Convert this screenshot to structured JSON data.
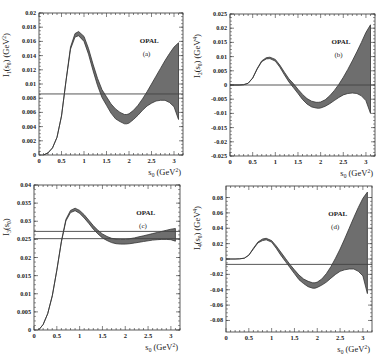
{
  "figure": {
    "experiment_label": "OPAL"
  },
  "chart_data": [
    {
      "id": "a",
      "type": "line",
      "panel_label": "(a)",
      "title": "",
      "legend": "OPAL",
      "xlabel": "s0 (GeV^2)",
      "ylabel": "I1(s0) (GeV^2)",
      "ylabel_main": "I",
      "ylabel_sub": "1",
      "ylabel_rest": "(s",
      "ylabel_unit": ") (GeV",
      "ylabel_pow": "2",
      "xlim": [
        0,
        3.2
      ],
      "ylim": [
        0,
        0.02
      ],
      "xticks": [
        0,
        0.5,
        1,
        1.5,
        2,
        2.5,
        3
      ],
      "xtick_labels": [
        "0",
        "0.5",
        "1",
        "1.5",
        "2",
        "2.5",
        "3"
      ],
      "yticks": [
        0,
        0.002,
        0.004,
        0.006,
        0.008,
        0.01,
        0.012,
        0.014,
        0.016,
        0.018,
        0.02
      ],
      "ytick_labels": [
        "0",
        "0.002",
        "0.004",
        "0.006",
        "0.008",
        "0.01",
        "0.012",
        "0.014",
        "0.016",
        "0.018",
        "0.02"
      ],
      "hlines": [
        0.0086
      ],
      "band": {
        "x": [
          0.1,
          0.2,
          0.3,
          0.4,
          0.5,
          0.6,
          0.7,
          0.8,
          0.88,
          1.0,
          1.1,
          1.2,
          1.3,
          1.4,
          1.5,
          1.6,
          1.7,
          1.8,
          1.9,
          1.95,
          2.0,
          2.1,
          2.2,
          2.3,
          2.4,
          2.5,
          2.6,
          2.7,
          2.8,
          2.9,
          3.0,
          3.1
        ],
        "upper": [
          0.0,
          0.0003,
          0.001,
          0.0025,
          0.0055,
          0.0105,
          0.0152,
          0.0171,
          0.0174,
          0.0167,
          0.015,
          0.0128,
          0.0108,
          0.0092,
          0.0082,
          0.0072,
          0.0065,
          0.006,
          0.0057,
          0.0057,
          0.0058,
          0.0063,
          0.007,
          0.0079,
          0.0089,
          0.01,
          0.0111,
          0.0122,
          0.0133,
          0.0143,
          0.0152,
          0.0158
        ],
        "lower": [
          0.0,
          0.0003,
          0.001,
          0.0025,
          0.0055,
          0.0104,
          0.0149,
          0.0166,
          0.0168,
          0.016,
          0.0142,
          0.0119,
          0.0098,
          0.0081,
          0.007,
          0.0059,
          0.0051,
          0.0047,
          0.0044,
          0.0044,
          0.0045,
          0.005,
          0.0056,
          0.0063,
          0.0069,
          0.0073,
          0.0076,
          0.0077,
          0.0077,
          0.0074,
          0.0068,
          0.005
        ]
      }
    },
    {
      "id": "b",
      "type": "line",
      "panel_label": "(b)",
      "title": "",
      "legend": "OPAL",
      "xlabel": "s0 (GeV^2)",
      "ylabel": "I2(s0) (GeV^4)",
      "ylabel_main": "I",
      "ylabel_sub": "2",
      "ylabel_rest": "(s",
      "ylabel_unit": ") (GeV",
      "ylabel_pow": "4",
      "xlim": [
        0,
        3.2
      ],
      "ylim": [
        -0.025,
        0.025
      ],
      "xticks": [
        0,
        0.5,
        1,
        1.5,
        2,
        2.5,
        3
      ],
      "xtick_labels": [
        "0",
        "0.5",
        "1",
        "1.5",
        "2",
        "2.5",
        "3"
      ],
      "yticks": [
        -0.025,
        -0.02,
        -0.015,
        -0.01,
        -0.005,
        0,
        0.005,
        0.01,
        0.015,
        0.02,
        0.025
      ],
      "ytick_labels": [
        "-0.025",
        "-0.02",
        "-0.015",
        "-0.01",
        "-0.005",
        "0",
        "0.005",
        "0.01",
        "0.015",
        "0.02",
        "0.025"
      ],
      "hlines": [
        0
      ],
      "band": {
        "x": [
          0.0,
          0.2,
          0.3,
          0.4,
          0.5,
          0.6,
          0.7,
          0.8,
          0.88,
          1.0,
          1.1,
          1.2,
          1.3,
          1.4,
          1.5,
          1.6,
          1.7,
          1.8,
          1.9,
          1.95,
          2.0,
          2.1,
          2.2,
          2.3,
          2.4,
          2.5,
          2.6,
          2.7,
          2.8,
          2.9,
          3.0,
          3.1
        ],
        "upper": [
          0.0,
          0.0,
          0.0001,
          0.0006,
          0.0025,
          0.0058,
          0.0085,
          0.0096,
          0.0098,
          0.009,
          0.007,
          0.0045,
          0.0022,
          0.0005,
          -0.0015,
          -0.0033,
          -0.0048,
          -0.0057,
          -0.0061,
          -0.0061,
          -0.006,
          -0.0052,
          -0.0038,
          -0.002,
          0.0002,
          0.0027,
          0.0055,
          0.0085,
          0.0117,
          0.015,
          0.0185,
          0.0212
        ],
        "lower": [
          0.0,
          0.0,
          0.0001,
          0.0006,
          0.0024,
          0.0056,
          0.0082,
          0.0092,
          0.0093,
          0.0084,
          0.0063,
          0.0036,
          0.0011,
          -0.0009,
          -0.003,
          -0.0051,
          -0.0067,
          -0.0077,
          -0.0081,
          -0.0082,
          -0.0081,
          -0.0075,
          -0.0066,
          -0.0055,
          -0.0044,
          -0.0035,
          -0.003,
          -0.0028,
          -0.003,
          -0.0038,
          -0.0055,
          -0.01
        ]
      }
    },
    {
      "id": "c",
      "type": "line",
      "panel_label": "(c)",
      "title": "",
      "legend": "OPAL",
      "xlabel": "s0 (GeV^2)",
      "ylabel": "I3(s0)",
      "ylabel_main": "I",
      "ylabel_sub": "3",
      "ylabel_rest": "(s",
      "ylabel_unit": ")",
      "ylabel_pow": "",
      "xlim": [
        0,
        3.2
      ],
      "ylim": [
        0,
        0.04
      ],
      "xticks": [
        0,
        0.5,
        1,
        1.5,
        2,
        2.5,
        3
      ],
      "xtick_labels": [
        "0",
        "0.5",
        "1",
        "1.5",
        "2",
        "2.5",
        "3"
      ],
      "yticks": [
        0,
        0.005,
        0.01,
        0.015,
        0.02,
        0.025,
        0.03,
        0.035,
        0.04
      ],
      "ytick_labels": [
        "0",
        "0.005",
        "0.01",
        "0.015",
        "0.02",
        "0.025",
        "0.03",
        "0.035",
        "0.04"
      ],
      "hlines": [
        0.0272,
        0.0252
      ],
      "band": {
        "x": [
          0.1,
          0.2,
          0.3,
          0.4,
          0.5,
          0.6,
          0.7,
          0.8,
          0.9,
          1.0,
          1.1,
          1.2,
          1.3,
          1.4,
          1.5,
          1.6,
          1.7,
          1.8,
          1.9,
          2.0,
          2.1,
          2.2,
          2.3,
          2.4,
          2.5,
          2.6,
          2.7,
          2.8,
          2.9,
          3.0,
          3.1
        ],
        "upper": [
          0.0,
          0.0015,
          0.0045,
          0.0095,
          0.0165,
          0.0245,
          0.0305,
          0.033,
          0.0336,
          0.033,
          0.0318,
          0.0303,
          0.0288,
          0.0275,
          0.0265,
          0.0258,
          0.0253,
          0.0251,
          0.025,
          0.025,
          0.0252,
          0.0254,
          0.0257,
          0.026,
          0.0263,
          0.0266,
          0.0269,
          0.0272,
          0.0275,
          0.0278,
          0.028
        ],
        "lower": [
          0.0,
          0.0015,
          0.0045,
          0.0094,
          0.0164,
          0.0243,
          0.0301,
          0.0324,
          0.0329,
          0.0322,
          0.0309,
          0.0294,
          0.0278,
          0.0265,
          0.0254,
          0.0247,
          0.0241,
          0.0238,
          0.0237,
          0.0237,
          0.0238,
          0.024,
          0.0242,
          0.0244,
          0.0246,
          0.0248,
          0.0249,
          0.025,
          0.025,
          0.0249,
          0.0245
        ]
      }
    },
    {
      "id": "d",
      "type": "line",
      "panel_label": "(d)",
      "title": "",
      "legend": "OPAL",
      "xlabel": "s0 (GeV^2)",
      "ylabel": "I4(s0) (GeV^4)",
      "ylabel_main": "I",
      "ylabel_sub": "4",
      "ylabel_rest": "(s",
      "ylabel_unit": ") (GeV",
      "ylabel_pow": "4",
      "xlim": [
        0,
        3.2
      ],
      "ylim": [
        -0.095,
        0.095
      ],
      "xticks": [
        0,
        0.5,
        1,
        1.5,
        2,
        2.5,
        3
      ],
      "xtick_labels": [
        "0",
        "0.5",
        "1",
        "1.5",
        "2",
        "2.5",
        "3"
      ],
      "yticks": [
        -0.08,
        -0.06,
        -0.04,
        -0.02,
        0,
        0.02,
        0.04,
        0.06,
        0.08
      ],
      "ytick_labels": [
        "-0.08",
        "-0.06",
        "-0.04",
        "-0.02",
        "0",
        "0.02",
        "0.04",
        "0.06",
        "0.08"
      ],
      "hlines": [
        -0.007
      ],
      "band": {
        "x": [
          0.0,
          0.2,
          0.3,
          0.4,
          0.5,
          0.6,
          0.7,
          0.8,
          0.88,
          1.0,
          1.1,
          1.2,
          1.3,
          1.4,
          1.5,
          1.6,
          1.7,
          1.8,
          1.9,
          1.95,
          2.0,
          2.1,
          2.2,
          2.3,
          2.4,
          2.5,
          2.6,
          2.7,
          2.8,
          2.9,
          3.0,
          3.1
        ],
        "upper": [
          0.0,
          0.0,
          0.0002,
          0.001,
          0.005,
          0.014,
          0.022,
          0.026,
          0.027,
          0.024,
          0.017,
          0.009,
          0.001,
          -0.007,
          -0.014,
          -0.021,
          -0.026,
          -0.029,
          -0.031,
          -0.031,
          -0.03,
          -0.026,
          -0.019,
          -0.01,
          0.001,
          0.013,
          0.026,
          0.04,
          0.054,
          0.067,
          0.079,
          0.087
        ],
        "lower": [
          0.0,
          0.0,
          0.0002,
          0.001,
          0.005,
          0.013,
          0.021,
          0.024,
          0.025,
          0.022,
          0.014,
          0.005,
          -0.003,
          -0.011,
          -0.019,
          -0.027,
          -0.032,
          -0.036,
          -0.038,
          -0.038,
          -0.037,
          -0.034,
          -0.03,
          -0.025,
          -0.02,
          -0.016,
          -0.014,
          -0.013,
          -0.013,
          -0.016,
          -0.022,
          -0.045
        ]
      }
    }
  ]
}
